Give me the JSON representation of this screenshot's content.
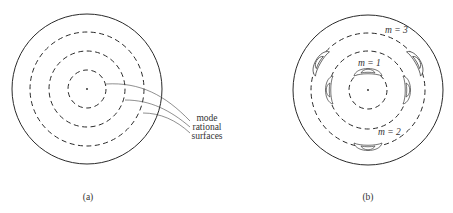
{
  "figure": {
    "header_cut_text": "",
    "panels": [
      {
        "id": "a",
        "caption": "(a)",
        "rational_surface_count": 3,
        "labels": [
          "mode",
          "rational",
          "surfaces"
        ]
      },
      {
        "id": "b",
        "caption": "(b)",
        "mode_labels": [
          {
            "text": "m = 1",
            "island_count": 1
          },
          {
            "text": "m = 2",
            "island_count": 2
          },
          {
            "text": "m = 3",
            "island_count": 3
          }
        ]
      }
    ]
  }
}
